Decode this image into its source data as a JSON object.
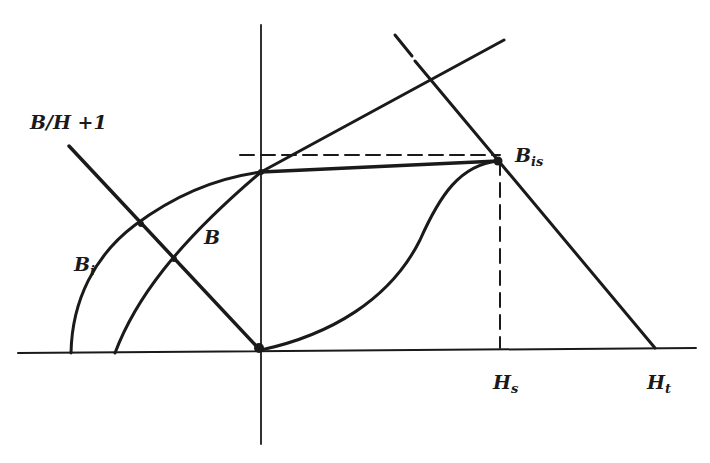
{
  "diagram": {
    "type": "magnetization-curve-construction",
    "colors": {
      "line": "#1a1a1a",
      "background": "#ffffff"
    },
    "labels": {
      "load_line": "B/H +1",
      "curve_b": "B",
      "curve_bi_base": "B",
      "curve_bi_sub": "i",
      "point_bis_base": "B",
      "point_bis_sub": "is",
      "axis_hs_base": "H",
      "axis_hs_sub": "s",
      "axis_ht_base": "H",
      "axis_ht_sub": "t"
    },
    "elements": [
      {
        "name": "horizontal-axis",
        "style": "solid"
      },
      {
        "name": "vertical-axis",
        "style": "solid"
      },
      {
        "name": "load-line-B/H+1",
        "style": "solid"
      },
      {
        "name": "intrinsic-curve-Bi",
        "style": "solid"
      },
      {
        "name": "induction-curve-B",
        "style": "solid"
      },
      {
        "name": "recoil-line-to-Bis",
        "style": "solid"
      },
      {
        "name": "s-curve-origin-to-Bis",
        "style": "solid"
      },
      {
        "name": "line-through-Bis-to-Ht",
        "style": "solid-with-dashed-extension"
      },
      {
        "name": "dashed-horizontal-at-Bis",
        "style": "dashed"
      },
      {
        "name": "dashed-vertical-at-Hs",
        "style": "dashed"
      }
    ],
    "caption": ""
  }
}
